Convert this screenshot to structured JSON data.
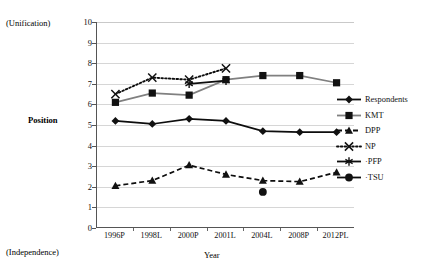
{
  "chart_data": {
    "type": "line",
    "title": "",
    "xlabel": "Year",
    "ylabel": "Position",
    "axis_annotations": {
      "top": "(Unification)",
      "bottom": "(Independence)"
    },
    "categories": [
      "1996P",
      "1998L",
      "2000P",
      "2001L",
      "2004L",
      "2008P",
      "2012PL"
    ],
    "ylim": [
      0,
      10
    ],
    "yticks": [
      "0",
      "1",
      "2",
      "3",
      "4",
      "5",
      "6",
      "7",
      "8",
      "9",
      "10"
    ],
    "grid": "horizontal",
    "legend_position": "right",
    "series": [
      {
        "name": "Respondents",
        "marker": "diamond",
        "line": "solid",
        "color": "#0d0d0d",
        "values": [
          5.2,
          5.05,
          5.3,
          5.2,
          4.7,
          4.65,
          4.65
        ]
      },
      {
        "name": "KMT",
        "marker": "square",
        "line": "solid",
        "color": "#808080",
        "values": [
          6.1,
          6.55,
          6.45,
          7.2,
          7.4,
          7.4,
          7.05
        ]
      },
      {
        "name": "DPP",
        "marker": "triangle",
        "line": "dashed",
        "color": "#0d0d0d",
        "values": [
          2.05,
          2.3,
          3.05,
          2.6,
          2.3,
          2.25,
          2.7
        ]
      },
      {
        "name": "NP",
        "marker": "cross",
        "line": "dotted",
        "color": "#0d0d0d",
        "values": [
          6.5,
          7.3,
          7.2,
          7.75,
          null,
          null,
          null
        ]
      },
      {
        "name": "PFP",
        "marker": "asterisk",
        "line": "solid",
        "color": "#0d0d0d",
        "values": [
          null,
          null,
          7.0,
          7.15,
          null,
          null,
          null
        ]
      },
      {
        "name": "TSU",
        "marker": "circle",
        "line": "solid",
        "color": "#0d0d0d",
        "values": [
          null,
          null,
          null,
          null,
          1.75,
          null,
          null
        ]
      }
    ]
  },
  "legend": {
    "entries": [
      {
        "label": "Respondents"
      },
      {
        "label": "KMT"
      },
      {
        "label": "DPP"
      },
      {
        "label": "NP"
      },
      {
        "label": "·PFP"
      },
      {
        "label": "·TSU"
      }
    ]
  }
}
